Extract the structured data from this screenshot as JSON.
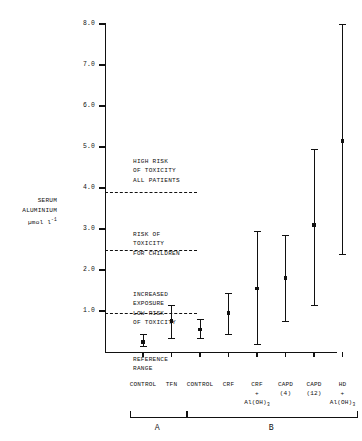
{
  "chart_data": {
    "type": "scatter",
    "title": "",
    "ylabel": "SERUM ALUMINIUM µmol l⁻¹",
    "xlabel": "",
    "ylim": [
      0,
      8.0
    ],
    "grid": false,
    "legend": "none",
    "yticks": [
      "8.0",
      "7.0",
      "6.0",
      "5.0",
      "4.0",
      "3.0",
      "2.0",
      "1.0"
    ],
    "ytick_values": [
      8.0,
      7.0,
      6.0,
      5.0,
      4.0,
      3.0,
      2.0,
      1.0
    ],
    "categories": [
      "CONTROL",
      "TFN",
      "CONTROL",
      "CRF",
      "CRF + Al(OH)3",
      "CAPD (4)",
      "CAPD (12)",
      "HD + Al(OH)3"
    ],
    "values": [
      0.25,
      0.75,
      0.55,
      0.95,
      1.55,
      1.8,
      3.1,
      5.15
    ],
    "error_low": [
      0.15,
      0.35,
      0.35,
      0.45,
      0.2,
      0.75,
      1.15,
      2.4
    ],
    "error_high": [
      0.45,
      1.15,
      0.8,
      1.45,
      2.95,
      2.85,
      4.95,
      8.0
    ],
    "threshold_lines": [
      {
        "value": 3.9,
        "label": "HIGH RISK OF TOXICITY ALL PATIENTS"
      },
      {
        "value": 2.5,
        "label": "RISK OF TOXICITY FOR CHILDREN"
      },
      {
        "value": 0.95,
        "label": "INCREASED EXPOSURE LOW RISK OF TOXICITY"
      }
    ],
    "zones": [
      {
        "lines": [
          "HIGH RISK",
          "OF TOXICITY",
          "ALL PATIENTS"
        ]
      },
      {
        "lines": [
          "RISK OF",
          "TOXICITY",
          "FOR CHILDREN"
        ]
      },
      {
        "lines": [
          "INCREASED",
          "EXPOSURE",
          "LOW RISK",
          "OF TOXICITY"
        ]
      },
      {
        "lines": [
          "REFERENCE",
          "RANGE"
        ]
      }
    ],
    "groups": [
      {
        "label": "A",
        "members": [
          "CONTROL",
          "TFN"
        ]
      },
      {
        "label": "B",
        "members": [
          "CONTROL",
          "CRF",
          "CRF + Al(OH)3",
          "CAPD (4)",
          "CAPD (12)",
          "HD + Al(OH)3"
        ]
      }
    ]
  },
  "yaxis": {
    "title_line1": "SERUM",
    "title_line2": "ALUMINIUM",
    "title_line3_prefix": "µmol l",
    "title_line3_sup": "-1",
    "ticks": [
      {
        "label": "8.0"
      },
      {
        "label": "7.0"
      },
      {
        "label": "6.0"
      },
      {
        "label": "5.0"
      },
      {
        "label": "4.0"
      },
      {
        "label": "3.0"
      },
      {
        "label": "2.0"
      },
      {
        "label": "1.0"
      }
    ]
  },
  "zone_text": {
    "high_risk": {
      "l1": "HIGH RISK",
      "l2": "OF TOXICITY",
      "l3": "ALL PATIENTS"
    },
    "children_risk": {
      "l1": "RISK OF",
      "l2": "TOXICITY",
      "l3": "FOR CHILDREN"
    },
    "increased_exposure": {
      "l1": "INCREASED",
      "l2": "EXPOSURE",
      "l3": "LOW RISK",
      "l4": "OF TOXICITY"
    },
    "reference": {
      "l1": "REFERENCE",
      "l2": "RANGE"
    }
  },
  "xcats": [
    {
      "l1": "CONTROL",
      "l2": "",
      "l3": ""
    },
    {
      "l1": "TFN",
      "l2": "",
      "l3": ""
    },
    {
      "l1": "CONTROL",
      "l2": "",
      "l3": ""
    },
    {
      "l1": "CRF",
      "l2": "",
      "l3": ""
    },
    {
      "l1": "CRF",
      "l2": "+",
      "l3": "Al(OH)"
    },
    {
      "l1": "CAPD",
      "l2": "",
      "l3": "(4)"
    },
    {
      "l1": "CAPD",
      "l2": "",
      "l3": "(12)"
    },
    {
      "l1": "HD",
      "l2": "+",
      "l3": "Al(OH)"
    }
  ],
  "groups": {
    "a_label": "A",
    "b_label": "B"
  },
  "colors": {
    "ink": "#111111",
    "background": "#ffffff"
  }
}
